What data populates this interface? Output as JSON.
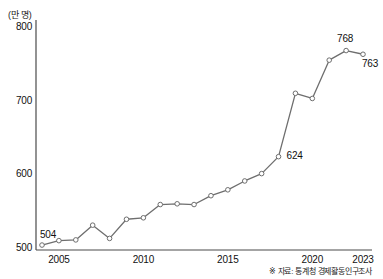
{
  "chart_data": {
    "type": "line",
    "title": "",
    "unit_label": "(만 명)",
    "xlabel": "",
    "ylabel": "",
    "ylim": [
      490,
      810
    ],
    "yticks": [
      500,
      600,
      700,
      800
    ],
    "xticks": [
      "2005",
      "2010",
      "2015",
      "2020",
      "2023"
    ],
    "grid": false,
    "legend": false,
    "x": [
      2004,
      2005,
      2006,
      2007,
      2008,
      2009,
      2010,
      2011,
      2012,
      2013,
      2014,
      2015,
      2016,
      2017,
      2018,
      2019,
      2020,
      2021,
      2022,
      2023
    ],
    "values": [
      504,
      510,
      511,
      531,
      513,
      539,
      541,
      559,
      560,
      559,
      571,
      579,
      591,
      601,
      624,
      710,
      703,
      755,
      768,
      763
    ],
    "point_labels": [
      {
        "index": 0,
        "text": "504"
      },
      {
        "index": 14,
        "text": "624"
      },
      {
        "index": 18,
        "text": "768"
      },
      {
        "index": 19,
        "text": "763"
      }
    ],
    "source": "※ 자료: 통계청 경제활동인구조사",
    "line_color": "#6e6e6e",
    "marker_fill": "#ffffff",
    "marker_stroke": "#6e6e6e",
    "axis_color": "#4a4a4a"
  }
}
